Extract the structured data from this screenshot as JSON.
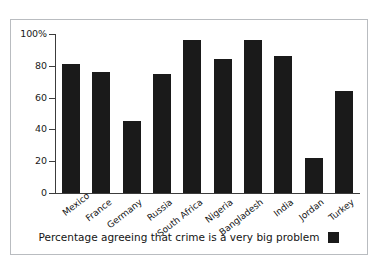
{
  "chart_data": {
    "type": "bar",
    "title": "",
    "subtitle": "",
    "xlabel": "",
    "ylabel": "",
    "categories": [
      "Mexico",
      "France",
      "Germany",
      "Russia",
      "South Africa",
      "Nigeria",
      "Bangladesh",
      "India",
      "Jordan",
      "Turkey"
    ],
    "values": [
      81,
      76,
      45,
      75,
      96,
      84,
      96,
      86,
      22,
      64
    ],
    "series": [
      {
        "name": "Percentage agreeing that crime is a very big problem",
        "values": [
          81,
          76,
          45,
          75,
          96,
          84,
          96,
          86,
          22,
          64
        ],
        "color": "#1a1a1a"
      }
    ],
    "ylim": [
      0,
      100
    ],
    "ytick_values": [
      0,
      20,
      40,
      60,
      80,
      100
    ],
    "ytick_labels": [
      "0",
      "20",
      "40",
      "60",
      "80",
      "100%"
    ],
    "grid": false,
    "legend": {
      "position": "bottom",
      "entries": [
        {
          "label": "Percentage agreeing that crime is a very big problem",
          "color": "#1a1a1a",
          "swatch": "filled-square"
        }
      ]
    },
    "annotations": []
  },
  "frame": {
    "border_color": "#b9bcc0",
    "background": "#ffffff"
  },
  "axis": {
    "line_color": "#3c3c3c"
  }
}
